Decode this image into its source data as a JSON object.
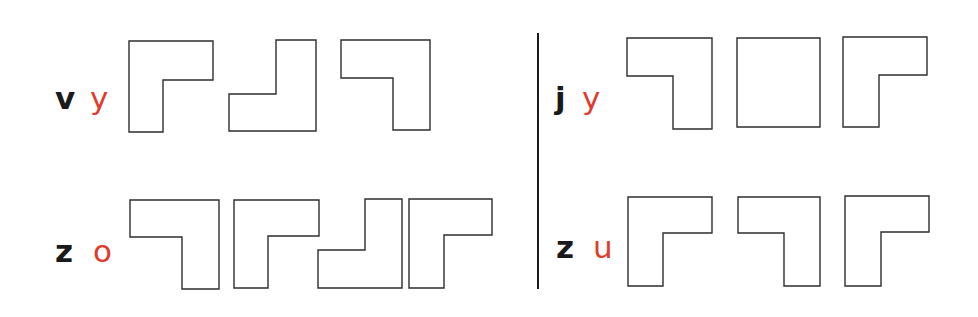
{
  "colors": {
    "label_black": "#1a1a1a",
    "label_red": "#e03c2c",
    "outline": "#2e2e2e",
    "background": "#ffffff"
  },
  "panels": [
    {
      "id": "top-left",
      "labels": [
        {
          "text": "v",
          "color": "black",
          "x": 55,
          "y": 83
        },
        {
          "text": "y",
          "color": "red",
          "x": 90,
          "y": 83
        }
      ],
      "shapes": [
        {
          "name": "l-shape-corner-top-left",
          "points": "129,41 213,41 213,80 163,80 163,132 129,132"
        },
        {
          "name": "l-shape-corner-bottom-right",
          "points": "276,40 316,40 316,131 229,131 229,94 276,94"
        },
        {
          "name": "l-shape-corner-top-right",
          "points": "341,40 430,40 430,130 393,130 393,78 341,78"
        }
      ]
    },
    {
      "id": "top-right",
      "labels": [
        {
          "text": "j",
          "color": "black",
          "x": 555,
          "y": 83
        },
        {
          "text": "y",
          "color": "red",
          "x": 582,
          "y": 83
        }
      ],
      "shapes": [
        {
          "name": "l-shape-corner-top-right",
          "points": "627,38 712,38 712,129 673,129 673,76 627,76"
        },
        {
          "name": "square-shape",
          "points": "737,38 820,38 820,127 737,127"
        },
        {
          "name": "l-shape-corner-top-left",
          "points": "843,37 927,37 927,75 879,75 879,127 843,127"
        }
      ]
    },
    {
      "id": "bottom-left",
      "labels": [
        {
          "text": "z",
          "color": "black",
          "x": 55,
          "y": 236
        },
        {
          "text": "o",
          "color": "red",
          "x": 93,
          "y": 236
        }
      ],
      "shapes": [
        {
          "name": "l-shape-corner-top-right",
          "points": "130,200 219,200 219,289 182,289 182,237 130,237"
        },
        {
          "name": "l-shape-corner-top-left",
          "points": "234,200 319,200 319,236 268,236 268,288 234,288"
        },
        {
          "name": "l-shape-corner-bottom-right",
          "points": "365,199 402,199 402,288 318,288 318,250 365,250"
        },
        {
          "name": "l-shape-corner-top-left",
          "points": "409,199 492,199 492,235 444,235 444,288 409,288"
        }
      ]
    },
    {
      "id": "bottom-right",
      "labels": [
        {
          "text": "z",
          "color": "black",
          "x": 556,
          "y": 232
        },
        {
          "text": "u",
          "color": "red",
          "x": 593,
          "y": 232
        }
      ],
      "shapes": [
        {
          "name": "l-shape-corner-top-left",
          "points": "628,197 712,197 712,233 663,233 663,286 628,286"
        },
        {
          "name": "l-shape-corner-top-right",
          "points": "738,197 820,197 820,286 784,286 784,233 738,233"
        },
        {
          "name": "l-shape-corner-top-left",
          "points": "845,196 929,196 929,232 881,232 881,286 845,286"
        }
      ]
    }
  ]
}
